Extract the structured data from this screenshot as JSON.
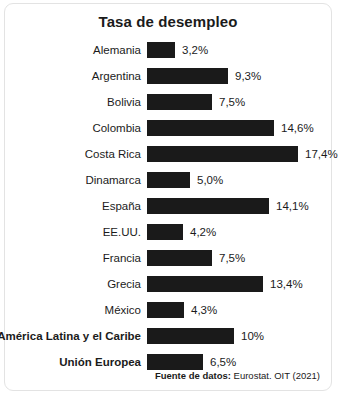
{
  "chart_data": {
    "type": "bar",
    "title": "Tasa de desempleo",
    "xlabel": "",
    "ylabel": "",
    "orientation": "horizontal",
    "grid": false,
    "legend": null,
    "xlim": [
      0,
      17.4
    ],
    "value_suffix": "%",
    "decimal_separator": ",",
    "categories": [
      "Alemania",
      "Argentina",
      "Bolivia",
      "Colombia",
      "Costa Rica",
      "Dinamarca",
      "España",
      "EE.UU.",
      "Francia",
      "Grecia",
      "México",
      "América Latina y el Caribe",
      "Unión Europea"
    ],
    "values": [
      3.2,
      9.3,
      7.5,
      14.6,
      17.4,
      5.0,
      14.1,
      4.2,
      7.5,
      13.4,
      4.3,
      10,
      6.5
    ],
    "value_labels": [
      "3,2%",
      "9,3%",
      "7,5%",
      "14,6%",
      "17,4%",
      "5,0%",
      "14,1%",
      "4,2%",
      "7,5%",
      "13,4%",
      "4,3%",
      "10%",
      "6,5%"
    ],
    "bar_color": "#1a1a1a",
    "background_color": "#ffffff",
    "text_color": "#1b1b1b",
    "bold_categories": [
      "América Latina y el Caribe",
      "Unión Europea"
    ]
  },
  "source": {
    "label": "Fuente de datos:",
    "text": " Eurostat. OIT (2021)"
  }
}
